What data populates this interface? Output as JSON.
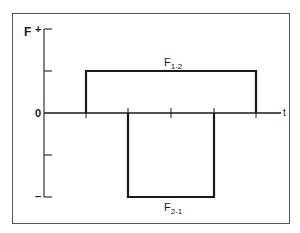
{
  "diagram": {
    "y_axis_label": "F",
    "plus_sign": "+",
    "minus_sign": "–",
    "zero_label": "0",
    "x_axis_label": "t",
    "upper_pulse": {
      "label_main": "F",
      "label_sub": "1-2",
      "sign": "positive"
    },
    "lower_pulse": {
      "label_main": "F",
      "label_sub": "2-1",
      "sign": "negative"
    },
    "colors": {
      "line": "#1a1a1a",
      "frame": "#555555",
      "background": "#ffffff"
    }
  }
}
